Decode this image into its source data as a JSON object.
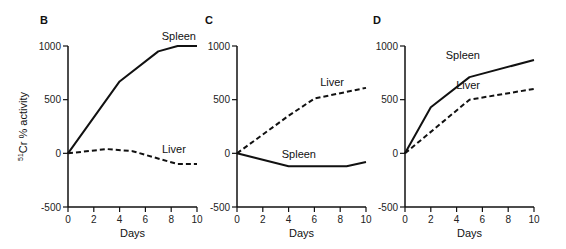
{
  "chart_data": [
    {
      "panel": "B",
      "type": "line",
      "title": "",
      "xlabel": "Days",
      "ylabel": "51Cr % activity",
      "xlim": [
        0,
        10
      ],
      "ylim": [
        -500,
        1000
      ],
      "xticks": [
        0,
        2,
        4,
        6,
        8,
        10
      ],
      "yticks": [
        -500,
        0,
        500,
        1000
      ],
      "grid": false,
      "series": [
        {
          "name": "Spleen",
          "style": "solid",
          "x": [
            0,
            4,
            7,
            8.5,
            10
          ],
          "y": [
            0,
            670,
            950,
            1000,
            1000
          ]
        },
        {
          "name": "Liver",
          "style": "dashed",
          "x": [
            0,
            3,
            5,
            8.5,
            10
          ],
          "y": [
            0,
            40,
            20,
            -100,
            -100
          ]
        }
      ]
    },
    {
      "panel": "C",
      "type": "line",
      "title": "",
      "xlabel": "Days",
      "ylabel": "",
      "xlim": [
        0,
        10
      ],
      "ylim": [
        -500,
        1000
      ],
      "xticks": [
        0,
        2,
        4,
        6,
        8,
        10
      ],
      "yticks": [
        -500,
        0,
        500,
        1000
      ],
      "grid": false,
      "series": [
        {
          "name": "Liver",
          "style": "dashed",
          "x": [
            0,
            4,
            6,
            10
          ],
          "y": [
            0,
            350,
            510,
            610
          ]
        },
        {
          "name": "Spleen",
          "style": "solid",
          "x": [
            0,
            4,
            8.5,
            10
          ],
          "y": [
            0,
            -120,
            -120,
            -80
          ]
        }
      ]
    },
    {
      "panel": "D",
      "type": "line",
      "title": "",
      "xlabel": "Days",
      "ylabel": "",
      "xlim": [
        0,
        10
      ],
      "ylim": [
        -500,
        1000
      ],
      "xticks": [
        0,
        2,
        4,
        6,
        8,
        10
      ],
      "yticks": [
        -500,
        0,
        500,
        1000
      ],
      "grid": false,
      "series": [
        {
          "name": "Spleen",
          "style": "solid",
          "x": [
            0,
            2,
            5,
            10
          ],
          "y": [
            0,
            430,
            710,
            870
          ]
        },
        {
          "name": "Liver",
          "style": "dashed",
          "x": [
            0,
            5,
            10
          ],
          "y": [
            0,
            500,
            600
          ]
        }
      ]
    }
  ],
  "layout": {
    "panels": [
      {
        "x0": 68,
        "x1": 197,
        "label_pos": [
          40,
          24
        ],
        "labels": [
          [
            196,
            40,
            "end"
          ],
          [
            162,
            153,
            "start"
          ]
        ]
      },
      {
        "x0": 237,
        "x1": 366,
        "label_pos": [
          205,
          24
        ],
        "labels": [
          [
            344,
            86,
            "end"
          ],
          [
            316,
            158,
            "end"
          ]
        ]
      },
      {
        "x0": 405,
        "x1": 534,
        "label_pos": [
          373,
          24
        ],
        "labels": [
          [
            480,
            59,
            "end"
          ],
          [
            480,
            89,
            "end"
          ]
        ]
      }
    ],
    "y_top": 46,
    "y_bottom": 207
  }
}
